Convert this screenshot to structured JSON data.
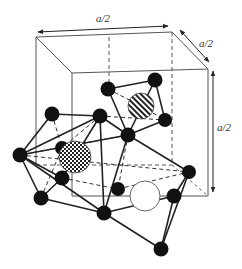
{
  "figure": {
    "type": "crystal-structure-diagram",
    "dimension_labels": {
      "top": "a/2",
      "depth": "a/2",
      "height": "a/2"
    },
    "colors": {
      "line": "#222222",
      "cube": "#555555",
      "atom": "#111111",
      "background": "#ffffff"
    },
    "cube": {
      "back_top_left": [
        36,
        37
      ],
      "back_top_right": [
        172,
        32
      ],
      "front_top_left": [
        72,
        73
      ],
      "front_top_right": [
        208,
        69
      ],
      "front_bottom_left": [
        72,
        196
      ],
      "front_bottom_right": [
        208,
        196
      ],
      "back_bottom_left": [
        36,
        165
      ],
      "back_bottom_right": [
        172,
        165
      ]
    },
    "atoms": [
      {
        "id": "A",
        "x": 108,
        "y": 89
      },
      {
        "id": "B",
        "x": 155,
        "y": 80
      },
      {
        "id": "C",
        "x": 165,
        "y": 120
      },
      {
        "id": "D",
        "x": 128,
        "y": 135
      },
      {
        "id": "E",
        "x": 52,
        "y": 114
      },
      {
        "id": "F",
        "x": 100,
        "y": 116
      },
      {
        "id": "G",
        "x": 20,
        "y": 155
      },
      {
        "id": "P",
        "x": 62,
        "y": 148
      },
      {
        "id": "H",
        "x": 62,
        "y": 178
      },
      {
        "id": "I",
        "x": 41,
        "y": 198
      },
      {
        "id": "J",
        "x": 118,
        "y": 189
      },
      {
        "id": "K",
        "x": 104,
        "y": 213
      },
      {
        "id": "L",
        "x": 189,
        "y": 172
      },
      {
        "id": "M",
        "x": 174,
        "y": 196
      },
      {
        "id": "N",
        "x": 161,
        "y": 249
      }
    ],
    "interstitials": [
      {
        "id": "hatched",
        "pattern": "diagonal-stripes",
        "x": 141,
        "y": 106,
        "r": 13
      },
      {
        "id": "checkered",
        "pattern": "checkerboard",
        "x": 75,
        "y": 157,
        "r": 16
      },
      {
        "id": "empty",
        "pattern": "white",
        "x": 145,
        "y": 196,
        "r": 15
      }
    ]
  }
}
